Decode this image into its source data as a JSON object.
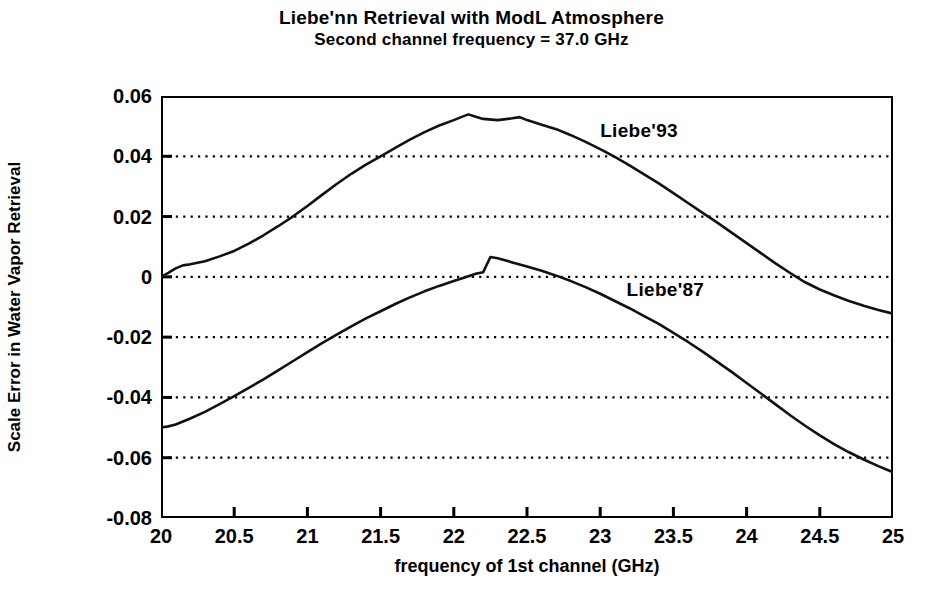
{
  "title": "Liebe'nn Retrieval with ModL Atmosphere",
  "subtitle": "Second channel frequency = 37.0 GHz",
  "axes": {
    "xlabel": "frequency of 1st channel (GHz)",
    "ylabel": "Scale Error in Water Vapor Retrieval",
    "xticks": [
      "20",
      "20.5",
      "21",
      "21.5",
      "22",
      "22.5",
      "23",
      "23.5",
      "24",
      "24.5",
      "25"
    ],
    "yticks": [
      "0.06",
      "0.04",
      "0.02",
      "0",
      "-0.02",
      "-0.04",
      "-0.06",
      "-0.08"
    ]
  },
  "annotations": {
    "upper_curve": "Liebe'93",
    "lower_curve": "Liebe'87"
  },
  "style": {
    "line_color": "#111111",
    "grid_color": "#000000",
    "frame_color": "#000000",
    "background": "#ffffff"
  },
  "chart_data": {
    "type": "line",
    "title": "Liebe'nn Retrieval with ModL Atmosphere",
    "subtitle": "Second channel frequency = 37.0 GHz",
    "xlabel": "frequency of 1st channel (GHz)",
    "ylabel": "Scale Error in Water Vapor Retrieval",
    "xlim": [
      20,
      25
    ],
    "ylim": [
      -0.08,
      0.06
    ],
    "xticks": [
      20,
      20.5,
      21,
      21.5,
      22,
      22.5,
      23,
      23.5,
      24,
      24.5,
      25
    ],
    "yticks": [
      0.06,
      0.04,
      0.02,
      0,
      -0.02,
      -0.04,
      -0.06,
      -0.08
    ],
    "grid": "horizontal-dotted",
    "legend": "inline-annotation",
    "series": [
      {
        "name": "Liebe'93",
        "label_position": {
          "x": 23.0,
          "y": 0.0435
        },
        "x": [
          20.0,
          20.05,
          20.1,
          20.15,
          20.2,
          20.3,
          20.4,
          20.5,
          20.6,
          20.7,
          20.8,
          20.9,
          21.0,
          21.1,
          21.2,
          21.3,
          21.4,
          21.5,
          21.6,
          21.7,
          21.8,
          21.9,
          22.0,
          22.05,
          22.1,
          22.15,
          22.2,
          22.3,
          22.4,
          22.45,
          22.5,
          22.6,
          22.7,
          22.8,
          22.9,
          23.0,
          23.1,
          23.2,
          23.3,
          23.4,
          23.5,
          23.6,
          23.7,
          23.8,
          23.9,
          24.0,
          24.1,
          24.2,
          24.3,
          24.4,
          24.5,
          24.6,
          24.7,
          24.8,
          24.9,
          25.0
        ],
        "y": [
          0.0,
          0.0013,
          0.0028,
          0.0038,
          0.0042,
          0.0052,
          0.0068,
          0.0086,
          0.011,
          0.0138,
          0.0168,
          0.02,
          0.0235,
          0.0272,
          0.0308,
          0.0342,
          0.0372,
          0.04,
          0.0428,
          0.0455,
          0.048,
          0.0502,
          0.052,
          0.053,
          0.0539,
          0.0531,
          0.0524,
          0.052,
          0.0526,
          0.053,
          0.052,
          0.0505,
          0.049,
          0.047,
          0.0448,
          0.0424,
          0.0398,
          0.037,
          0.034,
          0.031,
          0.0278,
          0.0245,
          0.0212,
          0.018,
          0.0146,
          0.0112,
          0.0078,
          0.0044,
          0.0012,
          -0.0018,
          -0.0042,
          -0.0062,
          -0.008,
          -0.0096,
          -0.011,
          -0.0122
        ]
      },
      {
        "name": "Liebe'87",
        "label_position": {
          "x": 23.18,
          "y": -0.0095
        },
        "x": [
          20.0,
          20.05,
          20.1,
          20.2,
          20.3,
          20.4,
          20.5,
          20.6,
          20.7,
          20.8,
          20.9,
          21.0,
          21.1,
          21.2,
          21.3,
          21.4,
          21.5,
          21.6,
          21.7,
          21.8,
          21.9,
          22.0,
          22.1,
          22.15,
          22.2,
          22.25,
          22.3,
          22.4,
          22.5,
          22.6,
          22.7,
          22.8,
          22.9,
          23.0,
          23.1,
          23.2,
          23.3,
          23.4,
          23.5,
          23.6,
          23.7,
          23.8,
          23.9,
          24.0,
          24.1,
          24.2,
          24.3,
          24.4,
          24.5,
          24.6,
          24.7,
          24.8,
          24.9,
          25.0
        ],
        "y": [
          -0.05,
          -0.0496,
          -0.049,
          -0.047,
          -0.0448,
          -0.0422,
          -0.0396,
          -0.0368,
          -0.034,
          -0.031,
          -0.028,
          -0.025,
          -0.022,
          -0.0192,
          -0.0164,
          -0.0138,
          -0.0114,
          -0.009,
          -0.0068,
          -0.0048,
          -0.003,
          -0.0014,
          0.0002,
          0.001,
          0.0015,
          0.0066,
          0.0062,
          0.0048,
          0.0034,
          0.002,
          0.0004,
          -0.0014,
          -0.0034,
          -0.0056,
          -0.008,
          -0.0104,
          -0.013,
          -0.0156,
          -0.0186,
          -0.0216,
          -0.0248,
          -0.0282,
          -0.0316,
          -0.0352,
          -0.0388,
          -0.0424,
          -0.046,
          -0.0494,
          -0.0526,
          -0.0556,
          -0.0582,
          -0.0606,
          -0.0628,
          -0.0648
        ]
      }
    ]
  }
}
